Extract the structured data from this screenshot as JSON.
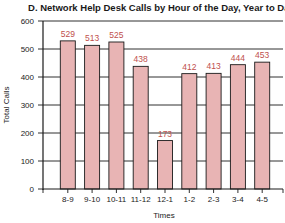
{
  "chart_data": {
    "type": "bar",
    "title": "D. Network Help Desk Calls by Hour of the Day, Year to Date",
    "xlabel": "Times",
    "ylabel": "Total Calls",
    "categories": [
      "8-9",
      "9-10",
      "10-11",
      "11-12",
      "12-1",
      "1-2",
      "2-3",
      "3-4",
      "4-5"
    ],
    "values": [
      529,
      513,
      525,
      438,
      173,
      412,
      413,
      444,
      453
    ],
    "ylim": [
      0,
      600
    ],
    "yticks": [
      0,
      100,
      200,
      300,
      400,
      500,
      600
    ],
    "grid": true,
    "legend": "none",
    "colors": {
      "bar_fill": "#e8b4b4",
      "bar_stroke": "#1a1a1a",
      "value_label": "#c0504d",
      "grid": "#1a1a1a"
    }
  }
}
